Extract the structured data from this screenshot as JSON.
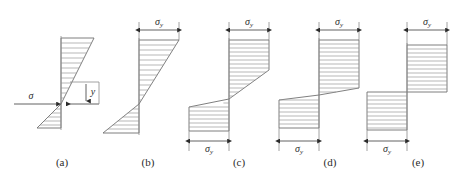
{
  "figure": {
    "width": 454,
    "height": 177,
    "background_color": "#ffffff",
    "outline_color": "#707070",
    "hatch_color": "#9a9a9a",
    "dimension_color": "#3a3a3a",
    "text_color": "#2b2b2b"
  },
  "symbols": {
    "sigma": "σ",
    "sigma_y_base": "σ",
    "sigma_y_sub": "y",
    "distance_y": "y"
  },
  "panels": [
    {
      "id": "a",
      "caption": "(a)",
      "caption_x": 62,
      "caption_y": 166,
      "stage": "elastic",
      "top_dimension_label": null,
      "bottom_dimension_label": null,
      "annotations": [
        {
          "name": "sigma-label",
          "text": "σ",
          "x": 31,
          "y": 96
        },
        {
          "name": "y-label",
          "text": "y",
          "x": 88,
          "y": 92
        }
      ],
      "has_sigma_arrow": true,
      "has_y_dimension": true,
      "neutral_axis_y": 104,
      "top_y": 38,
      "bottom_y": 128,
      "axis_x": 61,
      "top_half_max_width": 33,
      "bottom_half_max_width": 24,
      "hatch_count_top": 12,
      "hatch_count_bottom": 8
    },
    {
      "id": "b",
      "caption": "(b)",
      "caption_x": 148,
      "caption_y": 166,
      "stage": "yield-at-extreme-fibre",
      "top_dimension_label": "σy",
      "bottom_dimension_label": null,
      "annotations": [
        {
          "name": "sigma-y-top-label",
          "text": "σ",
          "sub": "y",
          "x": 153,
          "y": 20
        }
      ],
      "has_sigma_arrow": false,
      "has_y_dimension": false,
      "neutral_axis_y": 104,
      "top_y": 38,
      "bottom_y": 133,
      "axis_x": 139,
      "top_half_max_width": 40,
      "bottom_half_max_width": 36,
      "hatch_count_top": 13,
      "hatch_count_bottom": 10
    },
    {
      "id": "c",
      "caption": "(c)",
      "caption_x": 239,
      "caption_y": 166,
      "stage": "partially-plastic",
      "top_dimension_label": "σy",
      "bottom_dimension_label": "σy",
      "annotations": [
        {
          "name": "sigma-y-top-label",
          "text": "σ",
          "sub": "y",
          "x": 246,
          "y": 20
        },
        {
          "name": "sigma-y-bottom-label",
          "text": "σ",
          "sub": "y",
          "x": 224,
          "y": 148
        }
      ],
      "has_sigma_arrow": false,
      "has_y_dimension": false,
      "neutral_axis_y": 99,
      "top_y": 38,
      "bottom_y": 131,
      "axis_x": 229,
      "plastic_depth_top": 30,
      "plastic_depth_bottom": 24,
      "top_half_max_width": 40,
      "bottom_half_max_width": 40,
      "hatch_count_top": 14,
      "hatch_count_bottom": 10
    },
    {
      "id": "d",
      "caption": "(d)",
      "caption_x": 330,
      "caption_y": 166,
      "stage": "nearly-fully-plastic",
      "top_dimension_label": "σy",
      "bottom_dimension_label": "σy",
      "annotations": [
        {
          "name": "sigma-y-top-label",
          "text": "σ",
          "sub": "y",
          "x": 336,
          "y": 20
        },
        {
          "name": "sigma-y-bottom-label",
          "text": "σ",
          "sub": "y",
          "x": 314,
          "y": 148
        }
      ],
      "has_sigma_arrow": false,
      "has_y_dimension": false,
      "neutral_axis_y": 95,
      "top_y": 38,
      "bottom_y": 128,
      "axis_x": 319,
      "plastic_depth_top": 48,
      "plastic_depth_bottom": 28,
      "top_half_max_width": 40,
      "bottom_half_max_width": 40,
      "hatch_count_top": 13,
      "hatch_count_bottom": 8
    },
    {
      "id": "e",
      "caption": "(e)",
      "caption_x": 418,
      "caption_y": 166,
      "stage": "fully-plastic",
      "top_dimension_label": "σy",
      "bottom_dimension_label": "σy",
      "annotations": [
        {
          "name": "sigma-y-top-label",
          "text": "σ",
          "sub": "y",
          "x": 424,
          "y": 20
        },
        {
          "name": "sigma-y-bottom-label",
          "text": "σ",
          "sub": "y",
          "x": 402,
          "y": 148
        }
      ],
      "has_sigma_arrow": false,
      "has_y_dimension": false,
      "neutral_axis_y": 92,
      "top_y": 43,
      "bottom_y": 130,
      "axis_x": 407,
      "top_half_max_width": 40,
      "bottom_half_max_width": 40,
      "hatch_count_top": 11,
      "hatch_count_bottom": 9
    }
  ]
}
